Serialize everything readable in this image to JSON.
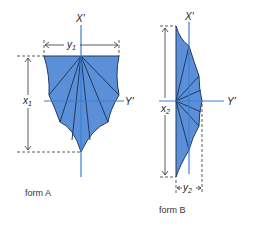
{
  "colors": {
    "fill": "#5b8fd8",
    "axis": "#3d7fd9",
    "edge": "#1f3a5f",
    "dim": "#333333"
  },
  "form_a": {
    "caption": "form A",
    "axis_x_label": "X'",
    "axis_y_label": "Y'",
    "width_label": "y",
    "width_sub": "1",
    "height_label": "x",
    "height_sub": "1"
  },
  "form_b": {
    "caption": "form B",
    "axis_x_label": "X'",
    "axis_y_label": "Y'",
    "width_label": "y",
    "width_sub": "2",
    "height_label": "x",
    "height_sub": "2"
  }
}
